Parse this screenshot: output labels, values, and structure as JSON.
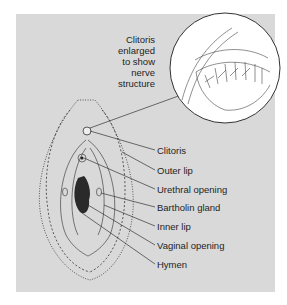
{
  "figure": {
    "callout": {
      "lines": [
        "Clitoris",
        "enlarged",
        "to show",
        "nerve",
        "structure"
      ]
    },
    "labels": [
      {
        "text": "Clitoris",
        "y": 150
      },
      {
        "text": "Outer lip",
        "y": 170
      },
      {
        "text": "Urethral opening",
        "y": 189
      },
      {
        "text": "Bartholin gland",
        "y": 207
      },
      {
        "text": "Inner lip",
        "y": 226
      },
      {
        "text": "Vaginal opening",
        "y": 245
      },
      {
        "text": "Hymen",
        "y": 264
      }
    ],
    "colors": {
      "panel": "#d9d9d9",
      "ink": "#1e1e1e",
      "inset": "#ffffff"
    }
  }
}
